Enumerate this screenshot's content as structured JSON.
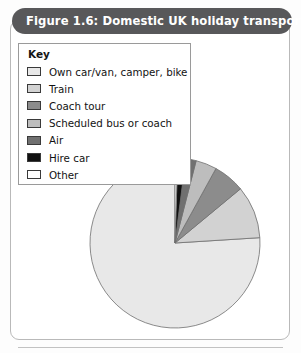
{
  "figure": {
    "title": "Figure 1.6: Domestic UK holiday transport, 1998",
    "title_bar_color": "#58585a",
    "title_text_color": "#ffffff"
  },
  "legend": {
    "heading": "Key",
    "items": [
      {
        "label": "Own car/van, camper, bike",
        "color": "#e8e8e8",
        "swatch": "legend-swatch-own-car"
      },
      {
        "label": "Train",
        "color": "#d2d2d2",
        "swatch": "legend-swatch-train"
      },
      {
        "label": "Coach tour",
        "color": "#8c8c8c",
        "swatch": "legend-swatch-coach-tour"
      },
      {
        "label": "Scheduled bus or coach",
        "color": "#bdbdbd",
        "swatch": "legend-swatch-scheduled-bus"
      },
      {
        "label": "Air",
        "color": "#707070",
        "swatch": "legend-swatch-air"
      },
      {
        "label": "Hire car",
        "color": "#111111",
        "swatch": "legend-swatch-hire-car"
      },
      {
        "label": "Other",
        "color": "#ffffff",
        "swatch": "legend-swatch-other"
      }
    ]
  },
  "chart_data": {
    "type": "pie",
    "title": "Figure 1.6: Domestic UK holiday transport, 1998",
    "xlabel": "",
    "ylabel": "",
    "legend_position": "top-left",
    "grid": false,
    "start_angle_deg": 0,
    "direction": "counter-clockwise",
    "categories": [
      "Own car/van, camper, bike",
      "Train",
      "Coach tour",
      "Scheduled bus or coach",
      "Air",
      "Hire car",
      "Other"
    ],
    "values": [
      76,
      10,
      6,
      4,
      2,
      1.5,
      0.5
    ],
    "unit": "percent",
    "colors": [
      "#e8e8e8",
      "#d2d2d2",
      "#8c8c8c",
      "#bdbdbd",
      "#707070",
      "#111111",
      "#ffffff"
    ],
    "slice_outline_color": "#6e6e6e",
    "center": {
      "x": 175,
      "y": 243
    },
    "radius": 85
  }
}
